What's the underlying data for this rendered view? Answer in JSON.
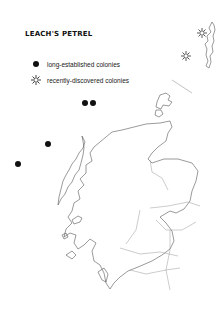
{
  "title": "LEACH'S PETREL",
  "legend": [
    {
      "symbol": "filled-dot-icon",
      "label": "long-established colonies"
    },
    {
      "symbol": "star-outline-icon",
      "label": "recently-discovered colonies"
    }
  ],
  "colonies": {
    "long_established": [
      [
        85,
        103
      ],
      [
        93,
        103
      ],
      [
        48,
        144
      ],
      [
        18,
        164
      ]
    ],
    "recently_discovered": [
      [
        202,
        33
      ],
      [
        186,
        56
      ]
    ]
  },
  "colors": {
    "ink": "#111111",
    "border": "#777777",
    "background": "#ffffff"
  }
}
